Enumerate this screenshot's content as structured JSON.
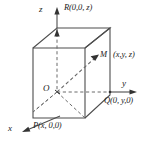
{
  "figure": {
    "type": "3d-coordinate-box-diagram",
    "stroke_color": "#4d4d4d",
    "text_color": "#1a1a1a",
    "background": "#ffffff"
  },
  "axes": [
    {
      "name": "z-axis",
      "label": "z",
      "direction": "up"
    },
    {
      "name": "y-axis",
      "label": "y",
      "direction": "right"
    },
    {
      "name": "x-axis",
      "label": "x",
      "direction": "down-left"
    }
  ],
  "points": [
    {
      "name": "origin",
      "label": "O",
      "coords": ""
    },
    {
      "name": "point-R",
      "label": "R",
      "coords": "(0,0, z)"
    },
    {
      "name": "point-M",
      "label": "M",
      "coords": "(x,y, z)"
    },
    {
      "name": "point-Q",
      "label": "Q",
      "coords": "(0, y,0)"
    },
    {
      "name": "point-P",
      "label": "P",
      "coords": "(x, 0,0)"
    }
  ],
  "labels": {
    "z_axis": "z",
    "y_axis": "y",
    "x_axis": "x",
    "origin": "O",
    "R_point": "R(0,0, z)",
    "M_point": "M",
    "M_coords": "(x,y, z)",
    "Q_point": "Q(0, y,0)",
    "P_point": "P(x, 0,0)"
  }
}
